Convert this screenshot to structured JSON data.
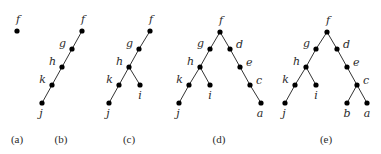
{
  "figure": {
    "colors": {
      "background": "#ffffff",
      "node": "#000000",
      "edge": "#333333",
      "text": "#2a2a2a"
    },
    "panels": [
      {
        "id": "a",
        "caption": "(a)",
        "caption_pos": [
          17,
          143
        ],
        "nodes": [
          {
            "label": "f",
            "x": 17,
            "y": 31,
            "lx": 18,
            "ly": 23,
            "anchor": "middle"
          }
        ],
        "edges": []
      },
      {
        "id": "b",
        "caption": "(b)",
        "caption_pos": [
          61,
          143
        ],
        "nodes": [
          {
            "label": "f",
            "x": 82,
            "y": 31,
            "lx": 83,
            "ly": 23,
            "anchor": "middle"
          },
          {
            "label": "g",
            "x": 72,
            "y": 49,
            "lx": 66,
            "ly": 47,
            "anchor": "end"
          },
          {
            "label": "h",
            "x": 62,
            "y": 67,
            "lx": 56,
            "ly": 65,
            "anchor": "end"
          },
          {
            "label": "k",
            "x": 52,
            "y": 85,
            "lx": 46,
            "ly": 83,
            "anchor": "end"
          },
          {
            "label": "j",
            "x": 42,
            "y": 103,
            "lx": 41,
            "ly": 117,
            "anchor": "middle"
          }
        ],
        "edges": [
          [
            "f",
            "g"
          ],
          [
            "g",
            "h"
          ],
          [
            "h",
            "k"
          ],
          [
            "k",
            "j"
          ]
        ]
      },
      {
        "id": "c",
        "caption": "(c)",
        "caption_pos": [
          129,
          143
        ],
        "nodes": [
          {
            "label": "f",
            "x": 150,
            "y": 31,
            "lx": 151,
            "ly": 23,
            "anchor": "middle"
          },
          {
            "label": "g",
            "x": 139,
            "y": 49,
            "lx": 133,
            "ly": 47,
            "anchor": "end"
          },
          {
            "label": "h",
            "x": 129,
            "y": 67,
            "lx": 123,
            "ly": 65,
            "anchor": "end"
          },
          {
            "label": "k",
            "x": 119,
            "y": 85,
            "lx": 113,
            "ly": 83,
            "anchor": "end"
          },
          {
            "label": "i",
            "x": 140,
            "y": 85,
            "lx": 140,
            "ly": 99,
            "anchor": "middle"
          },
          {
            "label": "j",
            "x": 109,
            "y": 103,
            "lx": 108,
            "ly": 117,
            "anchor": "middle"
          }
        ],
        "edges": [
          [
            "f",
            "g"
          ],
          [
            "g",
            "h"
          ],
          [
            "h",
            "k"
          ],
          [
            "h",
            "i"
          ],
          [
            "k",
            "j"
          ]
        ]
      },
      {
        "id": "d",
        "caption": "(d)",
        "caption_pos": [
          219,
          143
        ],
        "nodes": [
          {
            "label": "f",
            "x": 220,
            "y": 32,
            "lx": 221,
            "ly": 24,
            "anchor": "middle"
          },
          {
            "label": "g",
            "x": 210,
            "y": 49,
            "lx": 204,
            "ly": 47,
            "anchor": "end"
          },
          {
            "label": "d",
            "x": 230,
            "y": 49,
            "lx": 236,
            "ly": 48,
            "anchor": "start"
          },
          {
            "label": "h",
            "x": 200,
            "y": 67,
            "lx": 194,
            "ly": 65,
            "anchor": "end"
          },
          {
            "label": "e",
            "x": 240,
            "y": 67,
            "lx": 246,
            "ly": 66,
            "anchor": "start"
          },
          {
            "label": "k",
            "x": 189,
            "y": 85,
            "lx": 183,
            "ly": 83,
            "anchor": "end"
          },
          {
            "label": "i",
            "x": 210,
            "y": 85,
            "lx": 210,
            "ly": 99,
            "anchor": "middle"
          },
          {
            "label": "c",
            "x": 250,
            "y": 85,
            "lx": 256,
            "ly": 84,
            "anchor": "start"
          },
          {
            "label": "j",
            "x": 179,
            "y": 103,
            "lx": 178,
            "ly": 117,
            "anchor": "middle"
          },
          {
            "label": "a",
            "x": 261,
            "y": 103,
            "lx": 260,
            "ly": 117,
            "anchor": "middle"
          }
        ],
        "edges": [
          [
            "f",
            "g"
          ],
          [
            "f",
            "d"
          ],
          [
            "g",
            "h"
          ],
          [
            "d",
            "e"
          ],
          [
            "h",
            "k"
          ],
          [
            "h",
            "i"
          ],
          [
            "e",
            "c"
          ],
          [
            "k",
            "j"
          ],
          [
            "c",
            "a"
          ]
        ]
      },
      {
        "id": "e",
        "caption": "(e)",
        "caption_pos": [
          326,
          143
        ],
        "nodes": [
          {
            "label": "f",
            "x": 327,
            "y": 32,
            "lx": 328,
            "ly": 24,
            "anchor": "middle"
          },
          {
            "label": "g",
            "x": 316,
            "y": 49,
            "lx": 310,
            "ly": 47,
            "anchor": "end"
          },
          {
            "label": "d",
            "x": 337,
            "y": 49,
            "lx": 343,
            "ly": 48,
            "anchor": "start"
          },
          {
            "label": "h",
            "x": 306,
            "y": 67,
            "lx": 300,
            "ly": 65,
            "anchor": "end"
          },
          {
            "label": "e",
            "x": 347,
            "y": 67,
            "lx": 353,
            "ly": 66,
            "anchor": "start"
          },
          {
            "label": "k",
            "x": 295,
            "y": 85,
            "lx": 289,
            "ly": 83,
            "anchor": "end"
          },
          {
            "label": "i",
            "x": 316,
            "y": 85,
            "lx": 316,
            "ly": 99,
            "anchor": "middle"
          },
          {
            "label": "c",
            "x": 357,
            "y": 85,
            "lx": 363,
            "ly": 84,
            "anchor": "start"
          },
          {
            "label": "j",
            "x": 285,
            "y": 103,
            "lx": 284,
            "ly": 117,
            "anchor": "middle"
          },
          {
            "label": "b",
            "x": 347,
            "y": 103,
            "lx": 347,
            "ly": 117,
            "anchor": "middle"
          },
          {
            "label": "a",
            "x": 367,
            "y": 103,
            "lx": 367,
            "ly": 117,
            "anchor": "middle"
          }
        ],
        "edges": [
          [
            "f",
            "g"
          ],
          [
            "f",
            "d"
          ],
          [
            "g",
            "h"
          ],
          [
            "d",
            "e"
          ],
          [
            "h",
            "k"
          ],
          [
            "h",
            "i"
          ],
          [
            "e",
            "c"
          ],
          [
            "k",
            "j"
          ],
          [
            "c",
            "b"
          ],
          [
            "c",
            "a"
          ]
        ]
      }
    ]
  }
}
